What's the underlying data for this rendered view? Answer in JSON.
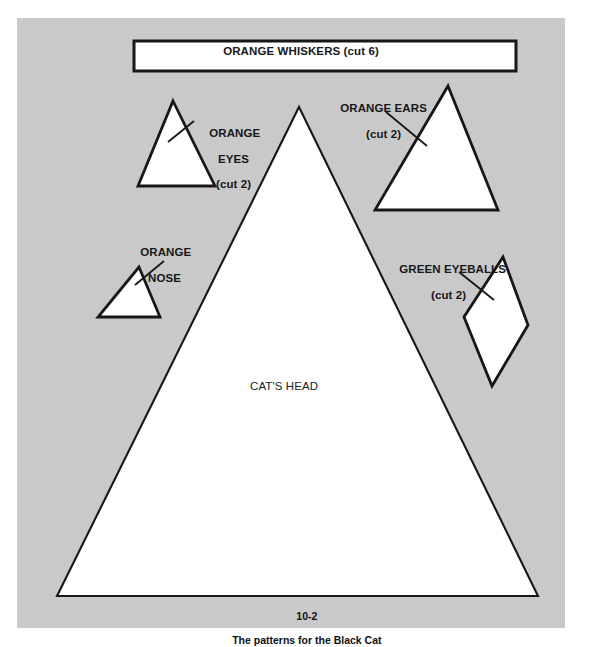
{
  "figure": {
    "caption_number": "10-2",
    "caption_text": "The patterns for the Black Cat",
    "background_color": "#c9c9c9",
    "ink_color": "#17171a",
    "paper_color": "#ffffff"
  },
  "pieces": {
    "whiskers": {
      "label": "ORANGE WHISKERS (cut 6)",
      "name_line": "ORANGE WHISKERS",
      "cut_line": "(cut 6)",
      "shape": "rectangle"
    },
    "eyes": {
      "name_line_1": "ORANGE",
      "name_line_2": "EYES",
      "cut_line": "(cut 2)",
      "shape": "triangle"
    },
    "ears": {
      "name_line_1": "ORANGE EARS",
      "cut_line": "(cut 2)",
      "shape": "triangle"
    },
    "nose": {
      "name_line_1": "ORANGE",
      "name_line_2": "NOSE",
      "cut_line": "",
      "shape": "triangle"
    },
    "eyeballs": {
      "name_line_1": "GREEN EYEBALLS",
      "cut_line": "(cut 2)",
      "shape": "diamond"
    },
    "head": {
      "label": "CAT'S HEAD",
      "shape": "triangle"
    }
  }
}
